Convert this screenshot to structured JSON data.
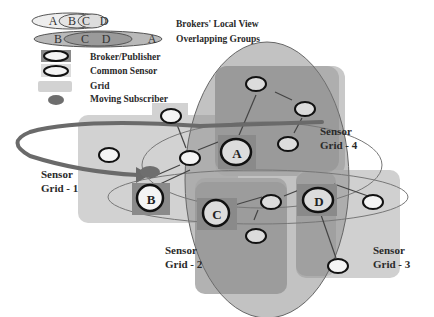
{
  "legend": {
    "items": [
      {
        "id": "brokers-local-view",
        "label": "Brokers' Local View",
        "glyph_letters": [
          "A",
          "B",
          "C",
          "D"
        ]
      },
      {
        "id": "overlapping-groups",
        "label": "Overlapping Groups",
        "glyph_letters": [
          "B",
          "C",
          "D",
          "A"
        ]
      },
      {
        "id": "broker-publisher",
        "label": "Broker/Publisher"
      },
      {
        "id": "common-sensor",
        "label": "Common Sensor"
      },
      {
        "id": "grid",
        "label": "Grid"
      },
      {
        "id": "moving-subscriber",
        "label": "Moving Subscriber"
      }
    ]
  },
  "grids": [
    {
      "id": "grid-1",
      "label_line1": "Sensor",
      "label_line2": "Grid - 1"
    },
    {
      "id": "grid-2",
      "label_line1": "Sensor",
      "label_line2": "Grid - 2"
    },
    {
      "id": "grid-3",
      "label_line1": "Sensor",
      "label_line2": "Grid - 3"
    },
    {
      "id": "grid-4",
      "label_line1": "Sensor",
      "label_line2": "Grid - 4"
    }
  ],
  "brokers": [
    {
      "id": "A",
      "label": "A"
    },
    {
      "id": "B",
      "label": "B"
    },
    {
      "id": "C",
      "label": "C"
    },
    {
      "id": "D",
      "label": "D"
    }
  ],
  "colors": {
    "grid_fill": "#d2d2d2",
    "grid_dark_fill": "#a9a9a9",
    "ellipse_fill": "#9d9d9d",
    "broker_square": "#8a8a8a",
    "sensor_fill": "#f4f4f4",
    "outline": "#1a1a1a",
    "subscriber": "#6e6e6e",
    "path_stroke": "#6a6a6a"
  }
}
